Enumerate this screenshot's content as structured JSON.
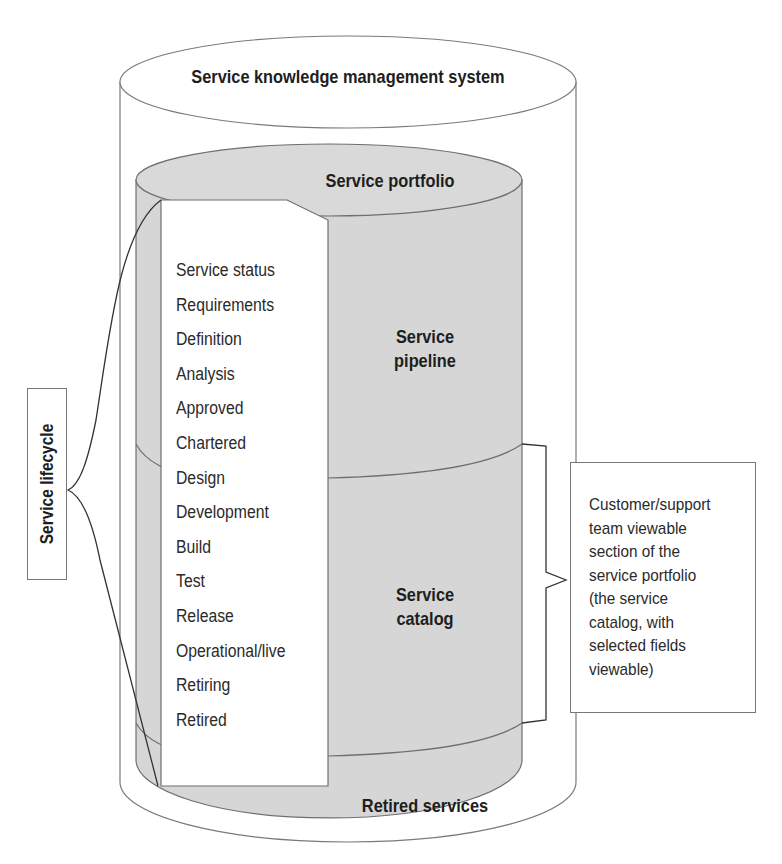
{
  "diagram": {
    "outer_cylinder": {
      "label": "Service knowledge management system"
    },
    "inner_cylinder": {
      "top_label": "Service portfolio",
      "sections": [
        {
          "label_line1": "Service",
          "label_line2": "pipeline"
        },
        {
          "label_line1": "Service",
          "label_line2": "catalog"
        },
        {
          "label": "Retired services"
        }
      ]
    },
    "lifecycle_label": "Service lifecycle",
    "status_list": [
      "Service status",
      "Requirements",
      "Definition",
      "Analysis",
      "Approved",
      "Chartered",
      "Design",
      "Development",
      "Build",
      "Test",
      "Release",
      "Operational/live",
      "Retiring",
      "Retired"
    ],
    "callout": {
      "lines": [
        "Customer/support",
        "team viewable",
        "section of the",
        "service portfolio",
        "(the service",
        "catalog, with",
        "selected fields",
        "viewable)"
      ]
    },
    "colors": {
      "cylinder_fill": "#d4d4d4",
      "outline": "#6f6f6f",
      "background": "#ffffff",
      "text": "#1e1e1e"
    }
  }
}
